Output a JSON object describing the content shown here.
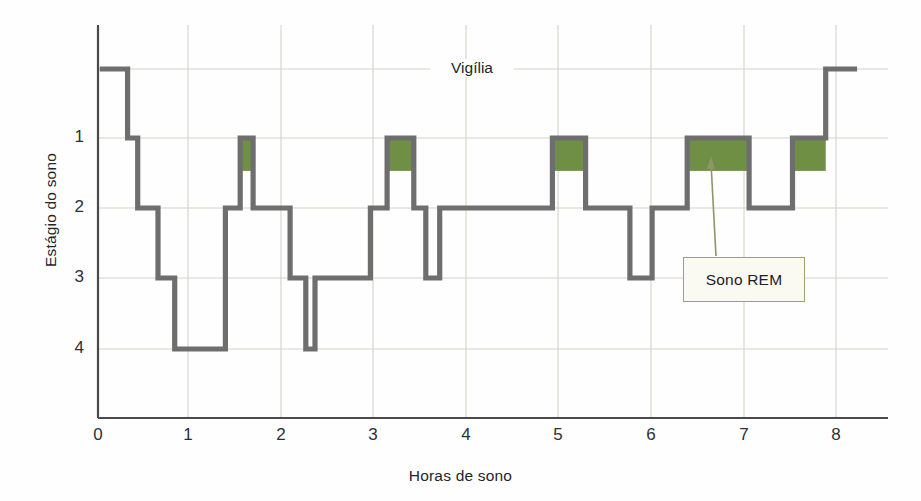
{
  "chart_data": {
    "type": "line",
    "subtype": "hypnogram-step",
    "title": "",
    "xlabel": "Horas de sono",
    "ylabel": "Estágio do sono",
    "xlim": [
      0,
      8.6
    ],
    "ylim_levels": [
      "Vigília",
      "1",
      "2",
      "3",
      "4"
    ],
    "xticks": [
      0,
      1,
      2,
      3,
      4,
      5,
      6,
      7,
      8
    ],
    "xticklabels": [
      "0",
      "1",
      "2",
      "3",
      "4",
      "5",
      "6",
      "7",
      "8"
    ],
    "yticks": [
      1,
      2,
      3,
      4
    ],
    "yticklabels": [
      "1",
      "2",
      "3",
      "4"
    ],
    "grid": true,
    "grid_color": "#cfcfc4",
    "line_color": "#6e6e6e",
    "rem_fill_color": "#6f8f45",
    "wake_gridline_label": "Vigília",
    "annotations": [
      {
        "text": "Vigília",
        "x": 4.05,
        "level": "wake"
      },
      {
        "text": "Sono REM",
        "x": 6.7,
        "level": "callout"
      }
    ],
    "segments": [
      {
        "start": 0.02,
        "end": 0.32,
        "level": 0,
        "rem": false
      },
      {
        "start": 0.32,
        "end": 0.43,
        "level": 1,
        "rem": false
      },
      {
        "start": 0.43,
        "end": 0.65,
        "level": 2,
        "rem": false
      },
      {
        "start": 0.65,
        "end": 0.83,
        "level": 3,
        "rem": false
      },
      {
        "start": 0.83,
        "end": 1.38,
        "level": 4,
        "rem": false
      },
      {
        "start": 1.38,
        "end": 1.54,
        "level": 2,
        "rem": false
      },
      {
        "start": 1.54,
        "end": 1.68,
        "level": 1,
        "rem": true
      },
      {
        "start": 1.68,
        "end": 2.08,
        "level": 2,
        "rem": false
      },
      {
        "start": 2.08,
        "end": 2.25,
        "level": 3,
        "rem": false
      },
      {
        "start": 2.25,
        "end": 2.35,
        "level": 4,
        "rem": false
      },
      {
        "start": 2.35,
        "end": 2.95,
        "level": 3,
        "rem": false
      },
      {
        "start": 2.95,
        "end": 3.13,
        "level": 2,
        "rem": false
      },
      {
        "start": 3.13,
        "end": 3.42,
        "level": 1,
        "rem": true
      },
      {
        "start": 3.42,
        "end": 3.55,
        "level": 2,
        "rem": false
      },
      {
        "start": 3.55,
        "end": 3.7,
        "level": 3,
        "rem": false
      },
      {
        "start": 3.7,
        "end": 4.92,
        "level": 2,
        "rem": false
      },
      {
        "start": 4.92,
        "end": 5.28,
        "level": 1,
        "rem": true
      },
      {
        "start": 5.28,
        "end": 5.76,
        "level": 2,
        "rem": false
      },
      {
        "start": 5.76,
        "end": 6.0,
        "level": 3,
        "rem": false
      },
      {
        "start": 6.0,
        "end": 6.38,
        "level": 2,
        "rem": false
      },
      {
        "start": 6.38,
        "end": 7.05,
        "level": 1,
        "rem": true
      },
      {
        "start": 7.05,
        "end": 7.52,
        "level": 2,
        "rem": false
      },
      {
        "start": 7.52,
        "end": 7.88,
        "level": 1,
        "rem": true
      },
      {
        "start": 7.88,
        "end": 8.22,
        "level": 0,
        "rem": false
      }
    ],
    "rem_blocks": [
      {
        "start": 1.54,
        "end": 1.68
      },
      {
        "start": 3.13,
        "end": 3.42
      },
      {
        "start": 4.92,
        "end": 5.28
      },
      {
        "start": 6.38,
        "end": 7.05
      },
      {
        "start": 7.52,
        "end": 7.88
      }
    ],
    "callout": {
      "label": "Sono REM",
      "border_color": "#9aa276",
      "fill_color": "#fbfaf2"
    }
  },
  "axes": {
    "x_title": "Horas de sono",
    "y_title": "Estágio do sono",
    "x_ticks": [
      "0",
      "1",
      "2",
      "3",
      "4",
      "5",
      "6",
      "7",
      "8"
    ],
    "y_ticks": [
      "1",
      "2",
      "3",
      "4"
    ],
    "wake_label": "Vigília"
  },
  "callout": {
    "label": "Sono REM"
  }
}
